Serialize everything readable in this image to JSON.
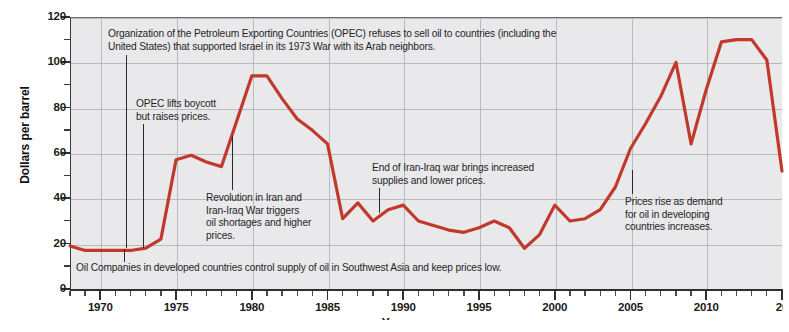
{
  "chart_data": {
    "type": "line",
    "title": "",
    "xlabel": "Year",
    "ylabel": "Dollars per barrel",
    "xlim": [
      1968,
      2015
    ],
    "ylim": [
      0,
      120
    ],
    "grid": true,
    "legend": "none",
    "series_color": "#c0392b",
    "y_ticks": [
      0,
      20,
      40,
      60,
      80,
      100,
      120
    ],
    "y_minor_ticks": [
      10,
      30,
      50,
      70,
      90,
      110
    ],
    "x_ticks": [
      1970,
      1975,
      1980,
      1985,
      1990,
      1995,
      2000,
      2005,
      2010,
      2015
    ],
    "x_tick_labels": [
      "1970",
      "1975",
      "1980",
      "1985",
      "1990",
      "1995",
      "2000",
      "2005",
      "2010",
      "20"
    ],
    "x": [
      1968,
      1969,
      1970,
      1971,
      1972,
      1973,
      1974,
      1975,
      1976,
      1977,
      1978,
      1979,
      1980,
      1981,
      1982,
      1983,
      1984,
      1985,
      1986,
      1987,
      1988,
      1989,
      1990,
      1991,
      1992,
      1993,
      1994,
      1995,
      1996,
      1997,
      1998,
      1999,
      2000,
      2001,
      2002,
      2003,
      2004,
      2005,
      2006,
      2007,
      2008,
      2009,
      2010,
      2011,
      2012,
      2013,
      2014,
      2015
    ],
    "values": [
      19,
      17,
      17,
      17,
      17,
      18,
      22,
      57,
      59,
      56,
      54,
      74,
      94,
      94,
      84,
      75,
      70,
      64,
      31,
      38,
      30,
      35,
      37,
      30,
      28,
      26,
      25,
      27,
      30,
      27,
      18,
      24,
      37,
      30,
      31,
      35,
      45,
      62,
      73,
      85,
      100,
      64,
      88,
      109,
      110,
      110,
      101,
      52
    ],
    "annotations": [
      {
        "id": "opec-boycott-1973",
        "text": "Organization of the Petroleum Exporting Countries (OPEC) refuses to sell oil to countries (including the\nUnited States) that supported Israel in its 1973 War with its Arab neighbors.",
        "year": 1973
      },
      {
        "id": "opec-lifts-boycott",
        "text": "OPEC lifts boycott\nbut raises prices.",
        "year": 1974
      },
      {
        "id": "iran-revolution",
        "text": "Revolution in Iran and\nIran-Iraq War triggers\noil shortages and higher\nprices.",
        "year": 1980
      },
      {
        "id": "end-iran-iraq-war",
        "text": "End of Iran-Iraq war brings increased\nsupplies and lower prices.",
        "year": 1989
      },
      {
        "id": "prices-rise-demand",
        "text": "Prices rise as demand\nfor oil in developing\ncountries increases.",
        "year": 2005
      },
      {
        "id": "oil-companies-control",
        "text": "Oil Companies in developed countries control supply of oil in Southwest Asia and keep prices low.",
        "year": 1970
      }
    ]
  }
}
